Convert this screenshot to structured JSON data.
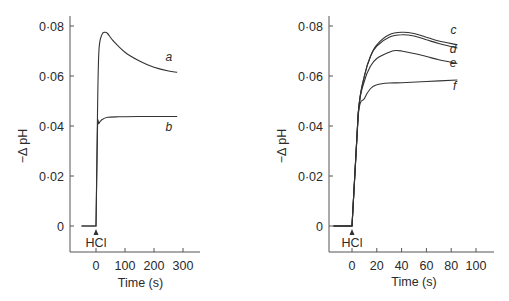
{
  "chart_data": [
    {
      "type": "line",
      "title": "",
      "xlabel": "Time (s)",
      "ylabel": "−Δ pH",
      "xlim": [
        -80,
        340
      ],
      "ylim": [
        -0.01,
        0.085
      ],
      "xticks": [
        0,
        100,
        200,
        300
      ],
      "xtick_labels": [
        "0",
        "100",
        "200",
        "300"
      ],
      "yticks": [
        0,
        0.02,
        0.04,
        0.06,
        0.08
      ],
      "ytick_labels": [
        "0",
        "0·02",
        "0·04",
        "0·06",
        "0·08"
      ],
      "grid": false,
      "annotation": {
        "text": "HCl",
        "x": 0,
        "arrow": "up",
        "meaning": "HCl addition at t = 0"
      },
      "series": [
        {
          "name": "a",
          "x": [
            -50,
            0,
            5,
            10,
            20,
            30,
            40,
            60,
            100,
            150,
            200,
            250,
            280
          ],
          "values": [
            0,
            0,
            0.045,
            0.07,
            0.0765,
            0.0775,
            0.077,
            0.074,
            0.0695,
            0.066,
            0.0635,
            0.062,
            0.0615
          ]
        },
        {
          "name": "b",
          "x": [
            -50,
            0,
            5,
            10,
            20,
            40,
            80,
            150,
            200,
            280
          ],
          "values": [
            0,
            0,
            0.039,
            0.041,
            0.0425,
            0.0435,
            0.0437,
            0.0438,
            0.0438,
            0.0438
          ]
        }
      ]
    },
    {
      "type": "line",
      "title": "",
      "xlabel": "Time (s)",
      "ylabel": "−Δ pH",
      "xlim": [
        -20,
        115
      ],
      "ylim": [
        -0.01,
        0.085
      ],
      "xticks": [
        0,
        20,
        40,
        60,
        80,
        100
      ],
      "xtick_labels": [
        "0",
        "20",
        "40",
        "60",
        "80",
        "100"
      ],
      "yticks": [
        0,
        0.02,
        0.04,
        0.06,
        0.08
      ],
      "ytick_labels": [
        "0",
        "0·02",
        "0·04",
        "0·06",
        "0·08"
      ],
      "grid": false,
      "annotation": {
        "text": "HCl",
        "x": 0,
        "arrow": "up",
        "meaning": "HCl addition at t = 0"
      },
      "series": [
        {
          "name": "c",
          "x": [
            -15,
            0,
            5,
            10,
            15,
            20,
            30,
            40,
            50,
            60,
            70,
            85
          ],
          "values": [
            0,
            0,
            0.045,
            0.06,
            0.068,
            0.0725,
            0.0765,
            0.0775,
            0.077,
            0.0755,
            0.074,
            0.0725
          ]
        },
        {
          "name": "d",
          "x": [
            -15,
            0,
            5,
            10,
            15,
            20,
            30,
            40,
            50,
            60,
            70,
            85
          ],
          "values": [
            0,
            0,
            0.045,
            0.06,
            0.068,
            0.072,
            0.0755,
            0.0765,
            0.076,
            0.0745,
            0.073,
            0.0712
          ]
        },
        {
          "name": "e",
          "x": [
            -15,
            0,
            5,
            10,
            15,
            20,
            30,
            35,
            40,
            50,
            60,
            70,
            85
          ],
          "values": [
            0,
            0,
            0.045,
            0.058,
            0.064,
            0.067,
            0.0695,
            0.0702,
            0.07,
            0.069,
            0.0678,
            0.0665,
            0.065
          ]
        },
        {
          "name": "f",
          "x": [
            -15,
            0,
            5,
            10,
            15,
            20,
            30,
            40,
            60,
            85
          ],
          "values": [
            0,
            0,
            0.044,
            0.051,
            0.055,
            0.0565,
            0.0572,
            0.0573,
            0.0578,
            0.0584
          ]
        }
      ]
    }
  ]
}
